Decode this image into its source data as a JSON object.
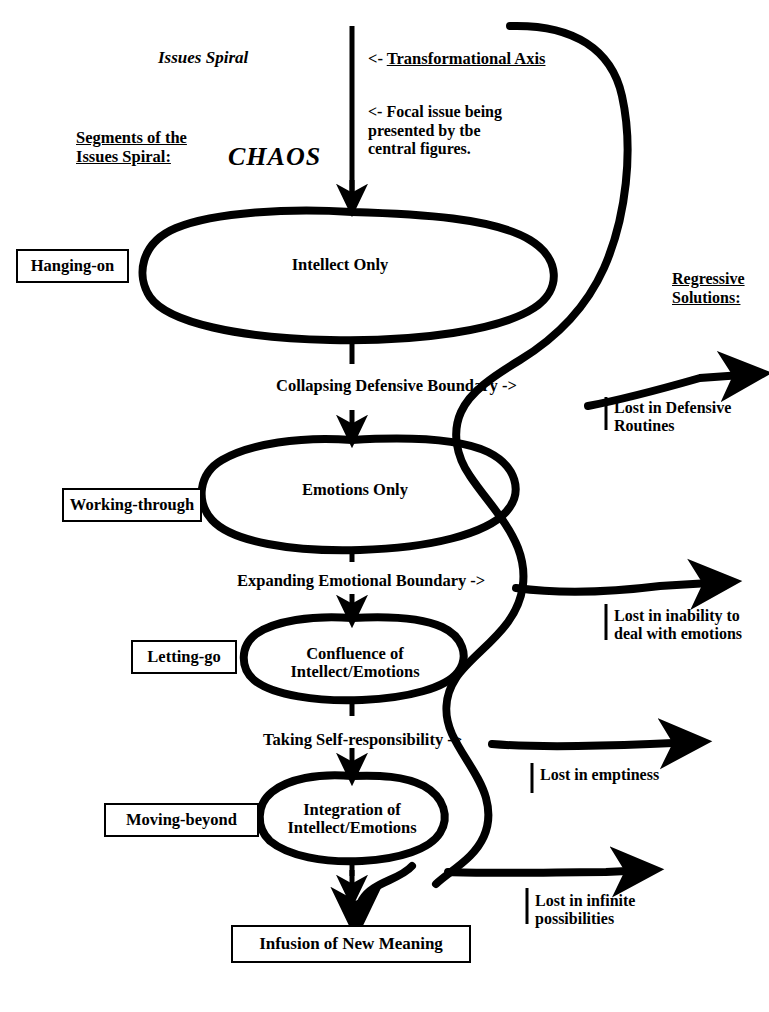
{
  "diagram": {
    "title": "Issues Spiral",
    "chaos_label": "CHAOS",
    "segments_heading": "Segments of the\nIssues Spiral:",
    "regressive_heading": "Regressive\nSolutions:",
    "axis_annotation_prefix": "<- ",
    "axis_annotation": "Transformational Axis",
    "focal_issue_annotation": "<- Focal issue being\n    presented by tbe\n    central figures.",
    "segments": [
      {
        "label": "Hanging-on"
      },
      {
        "label": "Working-through"
      },
      {
        "label": "Letting-go"
      },
      {
        "label": "Moving-beyond"
      }
    ],
    "nodes": [
      {
        "label": "Intellect Only"
      },
      {
        "label": "Emotions Only"
      },
      {
        "label": "Confluence of\nIntellect/Emotions"
      },
      {
        "label": "Integration of\nIntellect/Emotions"
      }
    ],
    "transitions": [
      {
        "label": "Collapsing Defensive Boundary ->"
      },
      {
        "label": "Expanding Emotional Boundary ->"
      },
      {
        "label": "Taking Self-responsibility ->"
      }
    ],
    "outcomes": [
      {
        "label": "Lost in Defensive\nRoutines"
      },
      {
        "label": "Lost in inability to\ndeal with emotions"
      },
      {
        "label": "Lost in emptiness"
      },
      {
        "label": "Lost in infinite\npossibilities"
      }
    ],
    "final_outcome": "Infusion of New Meaning",
    "colors": {
      "ink": "#000000",
      "background": "#ffffff"
    }
  }
}
